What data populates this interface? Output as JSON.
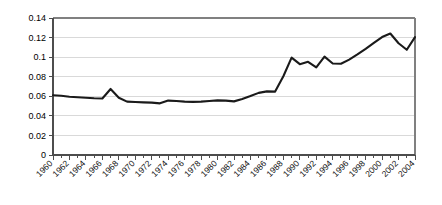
{
  "chart_data": {
    "type": "line",
    "title": "",
    "subtitle": "",
    "xlabel": "",
    "ylabel": "",
    "xlim": [
      1960,
      2004
    ],
    "ylim": [
      0,
      0.14
    ],
    "grid": true,
    "legend": false,
    "legend_position": "none",
    "y_ticks": [
      "0",
      "0.02",
      "0.04",
      "0.06",
      "0.08",
      "0.1",
      "0.12",
      "0.14"
    ],
    "y_tick_values": [
      0,
      0.02,
      0.04,
      0.06,
      0.08,
      0.1,
      0.12,
      0.14
    ],
    "x_tick_labels": [
      "1960",
      "1962",
      "1964",
      "1966",
      "1968",
      "1970",
      "1972",
      "1974",
      "1976",
      "1978",
      "1980",
      "1982",
      "1984",
      "1986",
      "1988",
      "1990",
      "1992",
      "1994",
      "1996",
      "1998",
      "2000",
      "2002",
      "2004"
    ],
    "x": [
      1960,
      1961,
      1962,
      1963,
      1964,
      1965,
      1966,
      1967,
      1968,
      1969,
      1970,
      1971,
      1972,
      1973,
      1974,
      1975,
      1976,
      1977,
      1978,
      1979,
      1980,
      1981,
      1982,
      1983,
      1984,
      1985,
      1986,
      1987,
      1988,
      1989,
      1990,
      1991,
      1992,
      1993,
      1994,
      1995,
      1996,
      1997,
      1998,
      1999,
      2000,
      2001,
      2002,
      2003,
      2004
    ],
    "values": [
      0.061,
      0.0605,
      0.0595,
      0.059,
      0.0585,
      0.058,
      0.0578,
      0.0675,
      0.0585,
      0.0545,
      0.0542,
      0.0538,
      0.0535,
      0.0528,
      0.0556,
      0.0552,
      0.0545,
      0.0543,
      0.0545,
      0.0552,
      0.0558,
      0.0556,
      0.0548,
      0.0572,
      0.0602,
      0.0635,
      0.065,
      0.0648,
      0.0805,
      0.0995,
      0.0928,
      0.0952,
      0.0895,
      0.1005,
      0.0935,
      0.0932,
      0.0975,
      0.1028,
      0.1085,
      0.1145,
      0.1205,
      0.1242,
      0.1142,
      0.1075,
      0.1205
    ],
    "colors": {
      "line": "#1a1a1a",
      "gridline": "#d9d9d9",
      "border": "#808080",
      "axis": "#4d4d4d",
      "background": "#ffffff",
      "tick_text": "#000000"
    }
  }
}
